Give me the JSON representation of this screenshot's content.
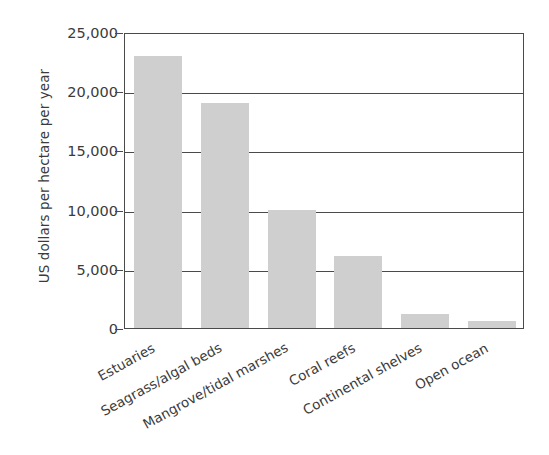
{
  "chart_data": {
    "type": "bar",
    "title": "",
    "subtitle": "",
    "xlabel": "",
    "ylabel": "US dollars per hectare per year",
    "categories": [
      "Estuaries",
      "Seagrass/algal beds",
      "Mangrove/tidal marshes",
      "Coral reefs",
      "Continental shelves",
      "Open ocean"
    ],
    "values": [
      23000,
      19000,
      10000,
      6100,
      1150,
      600
    ],
    "ylim": [
      0,
      25000
    ],
    "ytick_values": [
      0,
      5000,
      10000,
      15000,
      20000,
      25000
    ],
    "ytick_labels": [
      "0",
      "5,000",
      "10,000",
      "15,000",
      "20,000",
      "25,000"
    ],
    "grid": true,
    "grid_axis": "y",
    "legend": false,
    "legend_position": "none",
    "bar_color": "#cfcfcf",
    "axis_color": "#4a4a4a",
    "text_color": "#3b3b3b",
    "background": "#ffffff",
    "label_rotation_degrees": -29
  }
}
